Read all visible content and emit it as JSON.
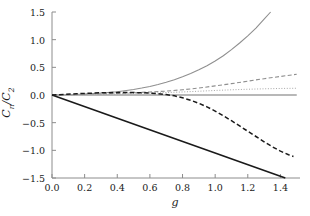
{
  "chart_data": {
    "type": "line",
    "title": "",
    "subtitle": "",
    "xlabel": "g",
    "ylabel": "Cn/C2",
    "ylabel_base": "C",
    "ylabel_sub1": "n",
    "ylabel_sep": "/C",
    "ylabel_sub2": "2",
    "xlim": [
      0.0,
      1.52
    ],
    "ylim": [
      -1.5,
      1.5
    ],
    "xticks": [
      0.0,
      0.2,
      0.4,
      0.6,
      0.8,
      1.0,
      1.2,
      1.4
    ],
    "xticklabels": [
      "0.0",
      "0.2",
      "0.4",
      "0.6",
      "0.8",
      "1.0",
      "1.2",
      "1.4"
    ],
    "yticks": [
      -1.5,
      -1.0,
      -0.5,
      0.0,
      0.5,
      1.0,
      1.5
    ],
    "yticklabels": [
      "−1.5",
      "−1.0",
      "−0.5",
      "0.0",
      "0.5",
      "1.0",
      "1.5"
    ],
    "grid": false,
    "legend": "none",
    "spines": [
      "left",
      "bottom"
    ],
    "colors": {
      "black": "#1a1a1a",
      "gray": "#9a9a9a",
      "gray_dotted": "#a8a8a8",
      "axis": "#8c8c8c",
      "text": "#1a1a1a",
      "background": "#ffffff"
    },
    "series": [
      {
        "name": "gray-solid-rising",
        "color": "#8f8f8f",
        "style": "solid",
        "width": 1.1,
        "x": [
          0.0,
          0.1,
          0.2,
          0.3,
          0.4,
          0.5,
          0.55,
          0.6,
          0.65,
          0.7,
          0.75,
          0.8,
          0.85,
          0.9,
          0.95,
          1.0,
          1.05,
          1.1,
          1.15,
          1.2,
          1.25,
          1.3,
          1.34
        ],
        "y": [
          0.0,
          0.004,
          0.016,
          0.035,
          0.06,
          0.1,
          0.125,
          0.155,
          0.19,
          0.23,
          0.275,
          0.33,
          0.39,
          0.455,
          0.53,
          0.615,
          0.71,
          0.82,
          0.94,
          1.07,
          1.21,
          1.37,
          1.5
        ]
      },
      {
        "name": "gray-dashed-rising",
        "color": "#8f8f8f",
        "style": "dashed",
        "width": 1.1,
        "x": [
          0.0,
          0.2,
          0.4,
          0.5,
          0.6,
          0.7,
          0.8,
          0.9,
          1.0,
          1.1,
          1.2,
          1.3,
          1.4,
          1.5
        ],
        "y": [
          0.0,
          0.01,
          0.03,
          0.042,
          0.055,
          0.07,
          0.095,
          0.125,
          0.165,
          0.205,
          0.25,
          0.295,
          0.335,
          0.375
        ]
      },
      {
        "name": "gray-dotted-rising",
        "color": "#a8a8a8",
        "style": "dotted",
        "width": 1.0,
        "x": [
          0.0,
          0.2,
          0.4,
          0.6,
          0.8,
          0.9,
          1.0,
          1.1,
          1.2,
          1.3,
          1.4,
          1.5
        ],
        "y": [
          0.0,
          0.006,
          0.018,
          0.034,
          0.055,
          0.068,
          0.082,
          0.094,
          0.104,
          0.112,
          0.118,
          0.122
        ]
      },
      {
        "name": "gray-solid-zero",
        "color": "#a0a0a0",
        "style": "solid",
        "width": 1.5,
        "x": [
          0.0,
          1.5
        ],
        "y": [
          0.0,
          0.0
        ]
      },
      {
        "name": "black-dashed-falling",
        "color": "#1a1a1a",
        "style": "dashed",
        "width": 1.5,
        "x": [
          0.0,
          0.15,
          0.3,
          0.4,
          0.5,
          0.6,
          0.65,
          0.7,
          0.75,
          0.8,
          0.85,
          0.9,
          0.95,
          1.0,
          1.05,
          1.1,
          1.15,
          1.2,
          1.25,
          1.3,
          1.35,
          1.4,
          1.45,
          1.48
        ],
        "y": [
          0.0,
          0.022,
          0.04,
          0.045,
          0.045,
          0.035,
          0.025,
          0.008,
          -0.015,
          -0.05,
          -0.095,
          -0.15,
          -0.215,
          -0.29,
          -0.375,
          -0.465,
          -0.56,
          -0.655,
          -0.75,
          -0.845,
          -0.935,
          -1.015,
          -1.08,
          -1.11
        ]
      },
      {
        "name": "black-solid-linear",
        "color": "#1a1a1a",
        "style": "solid",
        "width": 1.6,
        "x": [
          0.0,
          1.43
        ],
        "y": [
          0.0,
          -1.5
        ]
      }
    ]
  },
  "axes": {
    "xlabel": "g",
    "xticklabels": [
      "0.0",
      "0.2",
      "0.4",
      "0.6",
      "0.8",
      "1.0",
      "1.2",
      "1.4"
    ],
    "yticklabels": [
      "1.5",
      "1.0",
      "0.5",
      "0.0",
      "−0.5",
      "−1.0",
      "−1.5"
    ]
  }
}
